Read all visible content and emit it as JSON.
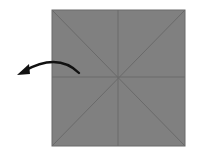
{
  "diagram": {
    "type": "origami-step",
    "paper": {
      "x": 52,
      "y": 10,
      "width": 133,
      "height": 136,
      "fill": "#808080",
      "stroke": "#6a6a6a"
    },
    "creases": [
      {
        "name": "diagonal-tl-br",
        "x1": 52,
        "y1": 10,
        "x2": 185,
        "y2": 146
      },
      {
        "name": "diagonal-tr-bl",
        "x1": 185,
        "y1": 10,
        "x2": 52,
        "y2": 146
      },
      {
        "name": "vertical-midline",
        "x1": 118,
        "y1": 10,
        "x2": 118,
        "y2": 146
      },
      {
        "name": "horizontal-midline",
        "x1": 52,
        "y1": 77,
        "x2": 185,
        "y2": 77
      }
    ],
    "crease_color": "#6a6a6a",
    "arrow": {
      "direction": "left",
      "meaning": "fold-left",
      "color": "#111111",
      "path": "M 79 73 Q 58 52 24 71"
    }
  }
}
